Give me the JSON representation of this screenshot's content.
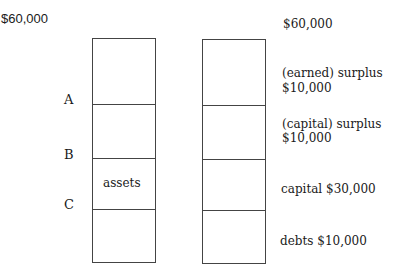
{
  "left": {
    "top_label": "$60,000",
    "markers": [
      "A",
      "B",
      "C"
    ],
    "box_label": "assets"
  },
  "right": {
    "top_label": "$60,000",
    "segments": [
      {
        "line1": "(earned) surplus",
        "line2": "$10,000"
      },
      {
        "line1": "(capital) surplus",
        "line2": "$10,000"
      },
      {
        "line1": "capital  $30,000",
        "line2": ""
      },
      {
        "line1": "debts  $10,000",
        "line2": ""
      }
    ]
  }
}
